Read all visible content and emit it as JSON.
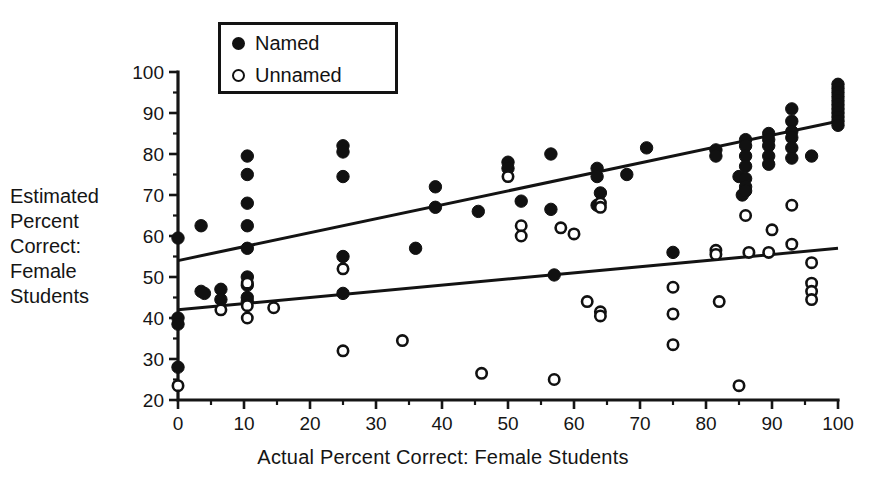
{
  "chart_data": {
    "type": "scatter",
    "title": "",
    "xlabel": "Actual Percent Correct: Female Students",
    "ylabel": "Estimated Percent Correct: Female Students",
    "ylabel_lines": [
      "Estimated",
      "Percent",
      "Correct:",
      "Female",
      "Students"
    ],
    "xlim": [
      0,
      100
    ],
    "ylim": [
      20,
      100
    ],
    "x_ticks": [
      0,
      10,
      20,
      30,
      40,
      50,
      60,
      70,
      80,
      90,
      100
    ],
    "y_ticks": [
      20,
      30,
      40,
      50,
      60,
      70,
      80,
      90,
      100
    ],
    "x_minor_step": 5,
    "y_minor_step": 5,
    "grid": false,
    "legend_position": "top-center",
    "legend_entries": [
      {
        "label": "Named",
        "marker": "filled-circle"
      },
      {
        "label": "Unnamed",
        "marker": "open-circle"
      }
    ],
    "series": [
      {
        "name": "Named",
        "marker": "filled-circle",
        "points": [
          [
            0,
            59.5
          ],
          [
            0,
            40.0
          ],
          [
            0,
            38.5
          ],
          [
            0,
            28.0
          ],
          [
            3.5,
            62.5
          ],
          [
            3.5,
            46.5
          ],
          [
            4.0,
            46.0
          ],
          [
            6.5,
            47.0
          ],
          [
            6.5,
            44.5
          ],
          [
            10.5,
            79.5
          ],
          [
            10.5,
            75.0
          ],
          [
            10.5,
            68.0
          ],
          [
            10.5,
            62.5
          ],
          [
            10.5,
            57.0
          ],
          [
            10.5,
            50.0
          ],
          [
            10.5,
            48.0
          ],
          [
            10.5,
            45.0
          ],
          [
            10.5,
            44.0
          ],
          [
            25.0,
            82.0
          ],
          [
            25.0,
            80.5
          ],
          [
            25.0,
            74.5
          ],
          [
            25.0,
            55.0
          ],
          [
            25.0,
            46.0
          ],
          [
            36.0,
            57.0
          ],
          [
            39.0,
            72.0
          ],
          [
            39.0,
            67.0
          ],
          [
            45.5,
            66.0
          ],
          [
            50.0,
            78.0
          ],
          [
            50.0,
            76.5
          ],
          [
            52.0,
            68.5
          ],
          [
            56.5,
            80.0
          ],
          [
            56.5,
            66.5
          ],
          [
            57.0,
            50.5
          ],
          [
            63.5,
            76.5
          ],
          [
            63.5,
            74.5
          ],
          [
            63.5,
            67.5
          ],
          [
            64.0,
            70.5
          ],
          [
            68.0,
            75.0
          ],
          [
            71.0,
            81.5
          ],
          [
            75.0,
            56.0
          ],
          [
            81.5,
            81.0
          ],
          [
            81.5,
            79.5
          ],
          [
            85.0,
            74.5
          ],
          [
            85.5,
            70.0
          ],
          [
            86.0,
            83.5
          ],
          [
            86.0,
            82.0
          ],
          [
            86.0,
            79.5
          ],
          [
            86.0,
            77.0
          ],
          [
            86.0,
            74.0
          ],
          [
            86.0,
            72.0
          ],
          [
            86.0,
            71.0
          ],
          [
            89.5,
            85.0
          ],
          [
            89.5,
            83.5
          ],
          [
            89.5,
            82.0
          ],
          [
            89.5,
            79.5
          ],
          [
            89.5,
            77.5
          ],
          [
            93.0,
            91.0
          ],
          [
            93.0,
            88.0
          ],
          [
            93.0,
            85.5
          ],
          [
            93.0,
            84.0
          ],
          [
            93.0,
            81.5
          ],
          [
            93.0,
            79.0
          ],
          [
            96.0,
            79.5
          ],
          [
            100,
            97.0
          ],
          [
            100,
            96.0
          ],
          [
            100,
            95.0
          ],
          [
            100,
            94.0
          ],
          [
            100,
            93.0
          ],
          [
            100,
            92.0
          ],
          [
            100,
            91.0
          ],
          [
            100,
            90.0
          ],
          [
            100,
            89.0
          ],
          [
            100,
            88.0
          ],
          [
            100,
            87.0
          ]
        ]
      },
      {
        "name": "Unnamed",
        "marker": "open-circle",
        "points": [
          [
            0,
            23.5
          ],
          [
            6.5,
            42.0
          ],
          [
            10.5,
            48.5
          ],
          [
            10.5,
            43.0
          ],
          [
            10.5,
            40.0
          ],
          [
            14.5,
            42.5
          ],
          [
            25.0,
            52.0
          ],
          [
            25.0,
            32.0
          ],
          [
            34.0,
            34.5
          ],
          [
            46.0,
            26.5
          ],
          [
            50.0,
            74.5
          ],
          [
            52.0,
            62.5
          ],
          [
            52.0,
            60.0
          ],
          [
            57.0,
            25.0
          ],
          [
            58.0,
            62.0
          ],
          [
            60.0,
            60.5
          ],
          [
            62.0,
            44.0
          ],
          [
            64.0,
            68.0
          ],
          [
            64.0,
            67.0
          ],
          [
            64.0,
            41.5
          ],
          [
            64.0,
            40.5
          ],
          [
            75.0,
            47.5
          ],
          [
            75.0,
            33.5
          ],
          [
            81.5,
            56.5
          ],
          [
            81.5,
            55.5
          ],
          [
            82.0,
            44.0
          ],
          [
            85.0,
            23.5
          ],
          [
            86.5,
            56.0
          ],
          [
            89.5,
            56.0
          ],
          [
            86.0,
            65.0
          ],
          [
            90.0,
            61.5
          ],
          [
            93.0,
            67.5
          ],
          [
            93.0,
            58.0
          ],
          [
            96.0,
            53.5
          ],
          [
            96.0,
            48.5
          ],
          [
            96.0,
            46.5
          ],
          [
            96.0,
            44.5
          ],
          [
            75.0,
            41.0
          ]
        ]
      }
    ],
    "fit_lines": [
      {
        "name": "Named fit",
        "x0": 0,
        "y0": 54.0,
        "x1": 100,
        "y1": 88.0
      },
      {
        "name": "Unnamed fit",
        "x0": 0,
        "y0": 42.0,
        "x1": 100,
        "y1": 57.0
      }
    ]
  },
  "colors": {
    "ink": "#111111",
    "background": "#ffffff"
  }
}
